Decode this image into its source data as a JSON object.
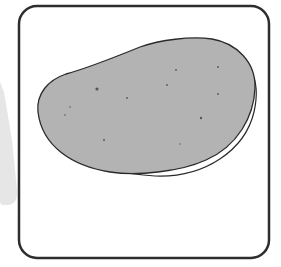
{
  "illustration": {
    "subject": "gray rounded blob with speckles inside a rounded square frame",
    "colors": {
      "background": "#ffffff",
      "frame_stroke": "#2e2e2e",
      "blob_fill": "#b3b3b3",
      "blob_outline": "#2a2a2a",
      "speckle": "#555555",
      "side_shape": "#e6e6e6"
    },
    "frame": {
      "x": 18,
      "y": 5,
      "width": 252,
      "height": 254,
      "corner_radius": 18,
      "stroke_width": 2.5
    },
    "speckles": [
      {
        "x": 97,
        "y": 89,
        "r": 1.6
      },
      {
        "x": 127,
        "y": 98,
        "r": 0.9
      },
      {
        "x": 167,
        "y": 85,
        "r": 0.9
      },
      {
        "x": 176,
        "y": 70,
        "r": 0.9
      },
      {
        "x": 218,
        "y": 67,
        "r": 0.9
      },
      {
        "x": 218,
        "y": 94,
        "r": 0.9
      },
      {
        "x": 201,
        "y": 118,
        "r": 1.2
      },
      {
        "x": 70,
        "y": 107,
        "r": 0.8
      },
      {
        "x": 65,
        "y": 115,
        "r": 0.8
      },
      {
        "x": 104,
        "y": 140,
        "r": 1.0
      },
      {
        "x": 180,
        "y": 144,
        "r": 0.7
      }
    ]
  }
}
